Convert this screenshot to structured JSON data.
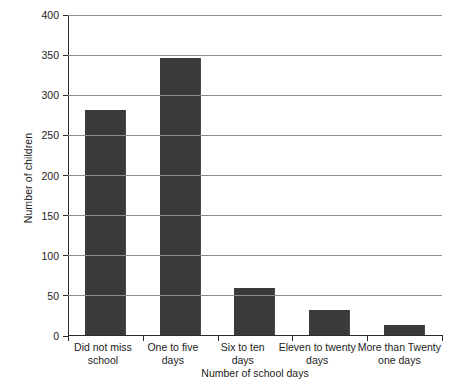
{
  "chart_data": {
    "type": "bar",
    "title": "",
    "subtitle": "",
    "xlabel": "Number of school days",
    "ylabel": "Number of children",
    "categories": [
      "Did not miss school",
      "One to five days",
      "Six to ten days",
      "Eleven to twenty days",
      "More than Twenty one days"
    ],
    "category_lines": [
      [
        "Did not miss",
        "school"
      ],
      [
        "One to five",
        "days"
      ],
      [
        "Six to ten",
        "days"
      ],
      [
        "Eleven to twenty",
        "days"
      ],
      [
        "More than Twenty",
        "one days"
      ]
    ],
    "values": [
      280,
      345,
      58,
      31,
      13
    ],
    "ylim": [
      0,
      400
    ],
    "ytick_values": [
      0,
      50,
      100,
      150,
      200,
      250,
      300,
      350,
      400
    ],
    "ytick_labels": [
      "0",
      "50",
      "100",
      "150",
      "200",
      "250",
      "300",
      "350",
      "400"
    ],
    "grid": true,
    "grid_axis": "y",
    "legend": false,
    "legend_position": "none",
    "bar_color": "#3a3a3a",
    "grid_color": "#8c8c8c",
    "axis_color": "#2b2b2b",
    "background_color": "#ffffff"
  }
}
